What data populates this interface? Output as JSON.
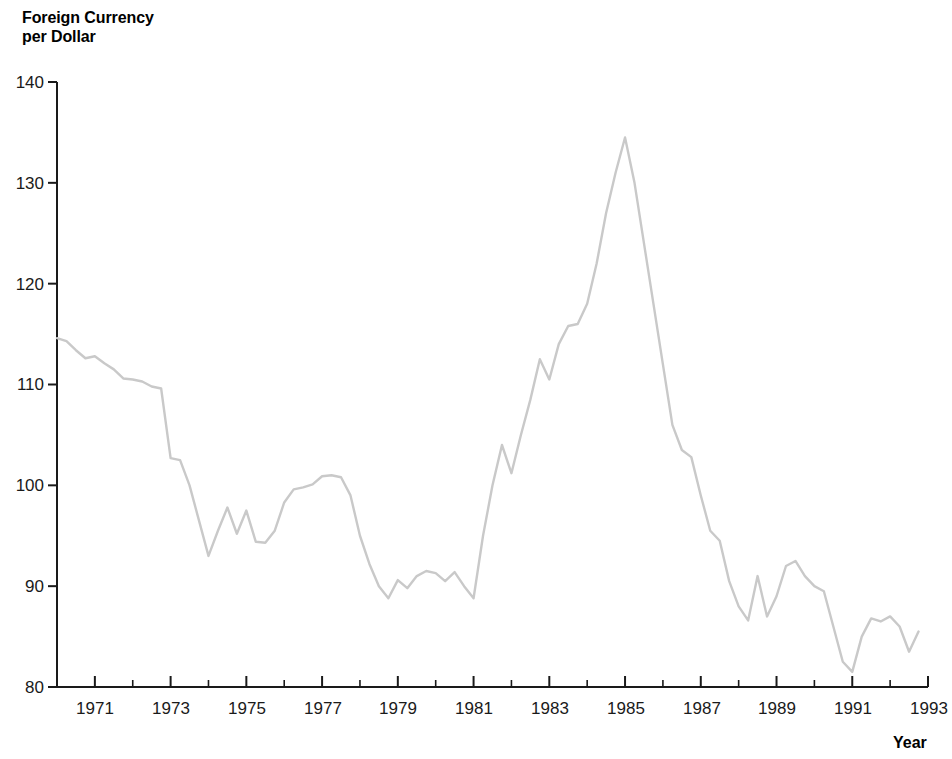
{
  "chart_data": {
    "type": "line",
    "title": "Foreign Currency per Dollar",
    "title_lines": [
      "Foreign Currency",
      "per Dollar"
    ],
    "xlabel": "Year",
    "ylabel": "Foreign Currency per Dollar",
    "xlim": [
      1970,
      1993
    ],
    "ylim": [
      80,
      140
    ],
    "yticks": [
      80,
      90,
      100,
      110,
      120,
      130,
      140
    ],
    "ytick_labels": [
      "80",
      "90",
      "100",
      "110",
      "120",
      "130",
      "140"
    ],
    "xticks": [
      1971,
      1973,
      1975,
      1977,
      1979,
      1981,
      1983,
      1985,
      1987,
      1989,
      1991,
      1993
    ],
    "xtick_labels": [
      "1971",
      "1973",
      "1975",
      "1977",
      "1979",
      "1981",
      "1983",
      "1985",
      "1987",
      "1989",
      "1991",
      "1993"
    ],
    "x_minor_tick_interval": 1,
    "grid": false,
    "legend": "none",
    "line_color": "#c9c9c9",
    "axis_color": "#1a1a1a",
    "background": "#ffffff",
    "series": [
      {
        "name": "Trade-weighted exchange value of the U.S. dollar",
        "x": [
          1970.0,
          1970.25,
          1970.5,
          1970.75,
          1971.0,
          1971.25,
          1971.5,
          1971.75,
          1972.0,
          1972.25,
          1972.5,
          1972.75,
          1973.0,
          1973.25,
          1973.5,
          1973.75,
          1974.0,
          1974.25,
          1974.5,
          1974.75,
          1975.0,
          1975.25,
          1975.5,
          1975.75,
          1976.0,
          1976.25,
          1976.5,
          1976.75,
          1977.0,
          1977.25,
          1977.5,
          1977.75,
          1978.0,
          1978.25,
          1978.5,
          1978.75,
          1979.0,
          1979.25,
          1979.5,
          1979.75,
          1980.0,
          1980.25,
          1980.5,
          1980.75,
          1981.0,
          1981.25,
          1981.5,
          1981.75,
          1982.0,
          1982.25,
          1982.5,
          1982.75,
          1983.0,
          1983.25,
          1983.5,
          1983.75,
          1984.0,
          1984.25,
          1984.5,
          1984.75,
          1985.0,
          1985.25,
          1985.5,
          1985.75,
          1986.0,
          1986.25,
          1986.5,
          1986.75,
          1987.0,
          1987.25,
          1987.5,
          1987.75,
          1988.0,
          1988.25,
          1988.5,
          1988.75,
          1989.0,
          1989.25,
          1989.5,
          1989.75,
          1990.0,
          1990.25,
          1990.5,
          1990.75,
          1991.0,
          1991.25,
          1991.5,
          1991.75,
          1992.0,
          1992.25,
          1992.5,
          1992.75
        ],
        "values": [
          114.6,
          114.3,
          113.4,
          112.6,
          112.8,
          112.1,
          111.5,
          110.6,
          110.5,
          110.3,
          109.8,
          109.6,
          102.7,
          102.5,
          100.0,
          96.5,
          93.0,
          95.5,
          97.8,
          95.2,
          97.5,
          94.4,
          94.3,
          95.5,
          98.3,
          99.6,
          99.8,
          100.1,
          100.9,
          101.0,
          100.8,
          99.0,
          95.0,
          92.2,
          90.0,
          88.8,
          90.6,
          89.8,
          91.0,
          91.5,
          91.3,
          90.5,
          91.4,
          90.0,
          88.8,
          95.0,
          100.0,
          104.0,
          101.2,
          105.0,
          108.5,
          112.5,
          110.5,
          114.0,
          115.8,
          116.0,
          118.0,
          122.0,
          127.0,
          131.0,
          134.5,
          130.0,
          124.0,
          118.0,
          112.0,
          106.0,
          103.5,
          102.8,
          99.0,
          95.5,
          94.5,
          90.5,
          88.0,
          86.6,
          91.0,
          87.0,
          89.0,
          92.0,
          92.5,
          91.0,
          90.0,
          89.5,
          86.0,
          82.5,
          81.5,
          85.0,
          86.8,
          86.5,
          87.0,
          86.0,
          83.5,
          85.5
        ]
      }
    ]
  }
}
